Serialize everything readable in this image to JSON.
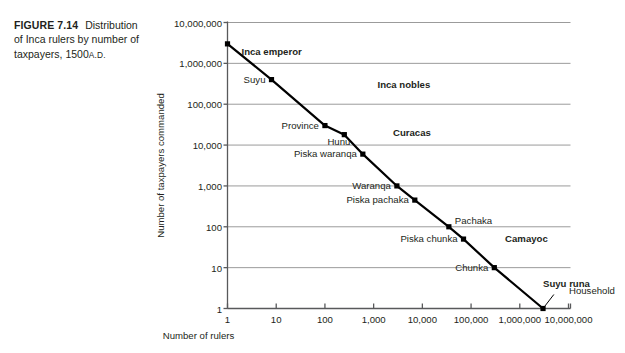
{
  "caption": {
    "figure_label": "FIGURE 7.14",
    "text": "Distribution of Inca rulers by number of taxpayers,",
    "year": "1500",
    "era": "A.D."
  },
  "chart_data": {
    "type": "line",
    "xlabel": "Number of rulers",
    "ylabel": "Number of taxpayers commanded",
    "xscale": "log",
    "yscale": "log",
    "xlim": [
      1,
      10000000
    ],
    "ylim": [
      1,
      10000000
    ],
    "grid": "horizontal",
    "legend": "none",
    "xticks": [
      "1",
      "10",
      "100",
      "1,000",
      "10,000",
      "100,000",
      "1,000,000",
      "10,000,000"
    ],
    "yticks": [
      "10,000,000",
      "1,000,000",
      "100,000",
      "10,000",
      "1,000",
      "100",
      "10",
      "1"
    ],
    "points": [
      {
        "label": "Inca emperor",
        "x": 1,
        "y": 3000000,
        "bold": true,
        "align": "left",
        "dx": 14,
        "dy": 8
      },
      {
        "label": "Suyu",
        "x": 8,
        "y": 400000,
        "bold": false,
        "align": "right",
        "dx": -6,
        "dy": 0
      },
      {
        "label": "Province",
        "x": 100,
        "y": 30000,
        "bold": false,
        "align": "right",
        "dx": -6,
        "dy": 0
      },
      {
        "label": "Hunu",
        "x": 250,
        "y": 18000,
        "bold": false,
        "align": "right",
        "dx": 6,
        "dy": 7
      },
      {
        "label": "Piska waranqa",
        "x": 600,
        "y": 6000,
        "bold": false,
        "align": "right",
        "dx": -6,
        "dy": 0
      },
      {
        "label": "Waranqa",
        "x": 3000,
        "y": 1000,
        "bold": false,
        "align": "right",
        "dx": -6,
        "dy": 0
      },
      {
        "label": "Piska pachaka",
        "x": 7000,
        "y": 450,
        "bold": false,
        "align": "right",
        "dx": -6,
        "dy": 0
      },
      {
        "label": "Pachaka",
        "x": 35000,
        "y": 100,
        "bold": false,
        "align": "left",
        "dx": 6,
        "dy": -6
      },
      {
        "label": "Piska chunka",
        "x": 70000,
        "y": 50,
        "bold": false,
        "align": "right",
        "dx": -6,
        "dy": 0
      },
      {
        "label": "Chunka",
        "x": 300000,
        "y": 10,
        "bold": false,
        "align": "right",
        "dx": -6,
        "dy": 0
      },
      {
        "label": "Household",
        "x": 3000000,
        "y": 1,
        "bold": false,
        "align": "left",
        "dx": 26,
        "dy": -18
      }
    ],
    "groups": [
      {
        "label": "Inca nobles",
        "x": 1200,
        "y": 300000
      },
      {
        "label": "Curacas",
        "x": 2500,
        "y": 20000
      },
      {
        "label": "Camayoc",
        "x": 500000,
        "y": 50
      },
      {
        "label": "Suyu runa",
        "x": 3000000,
        "y": 4
      }
    ],
    "leader_lines": [
      {
        "from_x": 3000000,
        "from_y": 1,
        "to_x": 5000000,
        "to_y": 2.2
      }
    ],
    "line_color": "#000000",
    "grid_color": "#9b9b9b",
    "axis_color": "#58595b"
  }
}
